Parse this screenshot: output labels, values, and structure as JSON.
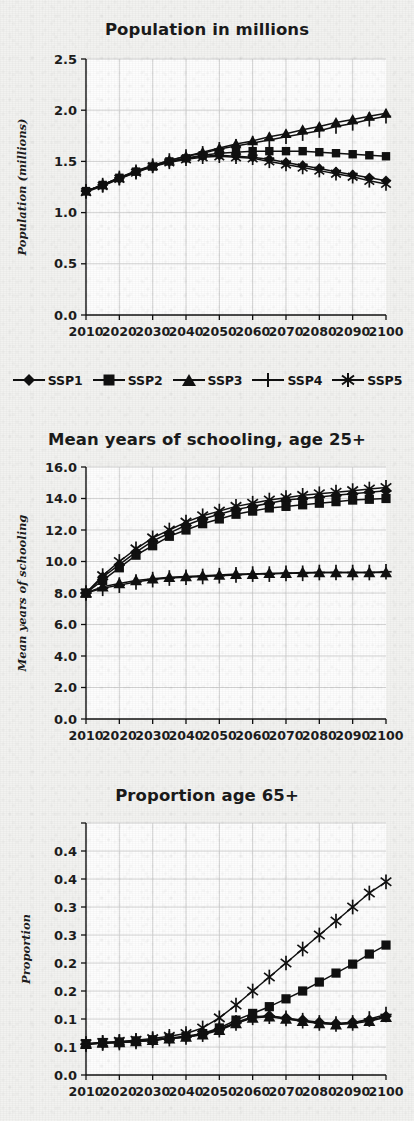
{
  "document": {
    "kind": "scanned-figure-page",
    "background_color": "#f2f2f0",
    "ink_color": "#111111",
    "grid_color": "#c9c9c9"
  },
  "legend": {
    "entries": [
      {
        "label": "SSP1",
        "marker": "diamond"
      },
      {
        "label": "SSP2",
        "marker": "square"
      },
      {
        "label": "SSP3",
        "marker": "triangle"
      },
      {
        "label": "SSP4",
        "marker": "plus"
      },
      {
        "label": "SSP5",
        "marker": "asterisk"
      }
    ]
  },
  "chart_data": [
    {
      "id": "population",
      "type": "line",
      "title": "Population in millions",
      "xlabel": "",
      "ylabel": "Population (millions)",
      "x": [
        2010,
        2015,
        2020,
        2025,
        2030,
        2035,
        2040,
        2045,
        2050,
        2055,
        2060,
        2065,
        2070,
        2075,
        2080,
        2085,
        2090,
        2095,
        2100
      ],
      "xticklabels": [
        "2010",
        "2020",
        "2030",
        "2040",
        "2050",
        "2060",
        "2070",
        "2080",
        "2090",
        "2100"
      ],
      "xlim": [
        2010,
        2100
      ],
      "ylim": [
        0.0,
        2.5
      ],
      "yticks": [
        0.0,
        0.5,
        1.0,
        1.5,
        2.0,
        2.5
      ],
      "yticklabels": [
        "0.0",
        "0.5",
        "1.0",
        "1.5",
        "2.0",
        "2.5"
      ],
      "grid": true,
      "legend_position": "bottom",
      "series": [
        {
          "name": "SSP1",
          "marker": "diamond",
          "values": [
            1.21,
            1.27,
            1.33,
            1.4,
            1.45,
            1.5,
            1.53,
            1.55,
            1.56,
            1.55,
            1.54,
            1.52,
            1.49,
            1.46,
            1.43,
            1.4,
            1.37,
            1.34,
            1.31
          ]
        },
        {
          "name": "SSP2",
          "marker": "square",
          "values": [
            1.21,
            1.27,
            1.34,
            1.4,
            1.45,
            1.5,
            1.53,
            1.56,
            1.58,
            1.59,
            1.6,
            1.6,
            1.6,
            1.6,
            1.59,
            1.58,
            1.57,
            1.56,
            1.55
          ]
        },
        {
          "name": "SSP3",
          "marker": "triangle",
          "values": [
            1.21,
            1.27,
            1.34,
            1.41,
            1.46,
            1.51,
            1.55,
            1.59,
            1.63,
            1.67,
            1.7,
            1.74,
            1.77,
            1.81,
            1.84,
            1.88,
            1.91,
            1.94,
            1.97
          ]
        },
        {
          "name": "SSP4",
          "marker": "plus",
          "values": [
            1.21,
            1.27,
            1.34,
            1.4,
            1.46,
            1.51,
            1.55,
            1.58,
            1.62,
            1.65,
            1.68,
            1.71,
            1.74,
            1.77,
            1.8,
            1.84,
            1.87,
            1.91,
            1.94
          ]
        },
        {
          "name": "SSP5",
          "marker": "asterisk",
          "values": [
            1.2,
            1.26,
            1.33,
            1.39,
            1.45,
            1.49,
            1.52,
            1.54,
            1.55,
            1.54,
            1.53,
            1.5,
            1.47,
            1.44,
            1.41,
            1.38,
            1.35,
            1.31,
            1.28
          ]
        }
      ]
    },
    {
      "id": "schooling",
      "type": "line",
      "title": "Mean years of schooling, age 25+",
      "xlabel": "",
      "ylabel": "Mean years of schooling",
      "x": [
        2010,
        2015,
        2020,
        2025,
        2030,
        2035,
        2040,
        2045,
        2050,
        2055,
        2060,
        2065,
        2070,
        2075,
        2080,
        2085,
        2090,
        2095,
        2100
      ],
      "xticklabels": [
        "2010",
        "2020",
        "2030",
        "2040",
        "2050",
        "2060",
        "2070",
        "2080",
        "2090",
        "2100"
      ],
      "xlim": [
        2010,
        2100
      ],
      "ylim": [
        0.0,
        16.0
      ],
      "yticks": [
        0.0,
        2.0,
        4.0,
        6.0,
        8.0,
        10.0,
        12.0,
        14.0,
        16.0
      ],
      "yticklabels": [
        "0.0",
        "2.0",
        "4.0",
        "6.0",
        "8.0",
        "10.0",
        "12.0",
        "14.0",
        "16.0"
      ],
      "grid": true,
      "legend_position": "none",
      "series": [
        {
          "name": "SSP1",
          "marker": "diamond",
          "values": [
            8.0,
            9.0,
            9.8,
            10.6,
            11.3,
            11.8,
            12.3,
            12.7,
            13.0,
            13.3,
            13.5,
            13.7,
            13.9,
            14.0,
            14.1,
            14.2,
            14.3,
            14.4,
            14.5
          ]
        },
        {
          "name": "SSP2",
          "marker": "square",
          "values": [
            8.0,
            8.8,
            9.6,
            10.4,
            11.0,
            11.6,
            12.0,
            12.4,
            12.7,
            13.0,
            13.2,
            13.4,
            13.5,
            13.6,
            13.7,
            13.8,
            13.9,
            13.95,
            14.0
          ]
        },
        {
          "name": "SSP3",
          "marker": "triangle",
          "values": [
            8.0,
            8.4,
            8.6,
            8.8,
            8.9,
            9.0,
            9.05,
            9.1,
            9.15,
            9.2,
            9.2,
            9.25,
            9.25,
            9.3,
            9.3,
            9.3,
            9.3,
            9.3,
            9.3
          ]
        },
        {
          "name": "SSP4",
          "marker": "plus",
          "values": [
            8.0,
            8.3,
            8.5,
            8.7,
            8.85,
            8.95,
            9.0,
            9.05,
            9.1,
            9.15,
            9.2,
            9.2,
            9.25,
            9.25,
            9.3,
            9.3,
            9.3,
            9.3,
            9.35
          ]
        },
        {
          "name": "SSP5",
          "marker": "asterisk",
          "values": [
            8.0,
            9.1,
            10.0,
            10.8,
            11.5,
            12.0,
            12.5,
            12.9,
            13.2,
            13.5,
            13.7,
            13.9,
            14.05,
            14.2,
            14.3,
            14.4,
            14.5,
            14.6,
            14.7
          ]
        }
      ]
    },
    {
      "id": "aging",
      "type": "line",
      "title": "Proportion age 65+",
      "xlabel": "",
      "ylabel": "Proportion",
      "x": [
        2010,
        2015,
        2020,
        2025,
        2030,
        2035,
        2040,
        2045,
        2050,
        2055,
        2060,
        2065,
        2070,
        2075,
        2080,
        2085,
        2090,
        2095,
        2100
      ],
      "xticklabels": [
        "2010",
        "2020",
        "2030",
        "2040",
        "2050",
        "2060",
        "2070",
        "2080",
        "2090",
        "2100"
      ],
      "xlim": [
        2010,
        2100
      ],
      "ylim": [
        0.0,
        0.45
      ],
      "yticks": [
        0.0,
        0.05,
        0.1,
        0.15,
        0.2,
        0.25,
        0.3,
        0.35,
        0.4,
        0.45
      ],
      "yticklabels": [
        "0.0",
        "0.1",
        "0.1",
        "0.2",
        "0.2",
        "0.3",
        "0.3",
        "0.4",
        "0.4"
      ],
      "grid": true,
      "legend_position": "none",
      "series": [
        {
          "name": "SSP1",
          "marker": "diamond",
          "values": [
            0.055,
            0.057,
            0.058,
            0.06,
            0.062,
            0.065,
            0.068,
            0.073,
            0.082,
            0.094,
            0.104,
            0.106,
            0.102,
            0.098,
            0.094,
            0.092,
            0.094,
            0.098,
            0.105
          ]
        },
        {
          "name": "SSP2",
          "marker": "square",
          "values": [
            0.056,
            0.058,
            0.059,
            0.061,
            0.063,
            0.066,
            0.069,
            0.074,
            0.084,
            0.098,
            0.11,
            0.122,
            0.136,
            0.15,
            0.166,
            0.182,
            0.198,
            0.216,
            0.232
          ]
        },
        {
          "name": "SSP3",
          "marker": "triangle",
          "values": [
            0.055,
            0.057,
            0.058,
            0.06,
            0.062,
            0.065,
            0.068,
            0.072,
            0.08,
            0.092,
            0.102,
            0.104,
            0.1,
            0.096,
            0.092,
            0.09,
            0.092,
            0.096,
            0.103
          ]
        },
        {
          "name": "SSP4",
          "marker": "plus",
          "values": [
            0.055,
            0.057,
            0.058,
            0.06,
            0.062,
            0.065,
            0.068,
            0.073,
            0.081,
            0.093,
            0.103,
            0.105,
            0.101,
            0.097,
            0.093,
            0.091,
            0.093,
            0.1,
            0.108
          ]
        },
        {
          "name": "SSP5",
          "marker": "asterisk",
          "values": [
            0.056,
            0.058,
            0.06,
            0.062,
            0.065,
            0.069,
            0.074,
            0.084,
            0.102,
            0.125,
            0.15,
            0.175,
            0.2,
            0.225,
            0.25,
            0.275,
            0.3,
            0.325,
            0.345
          ]
        }
      ]
    }
  ]
}
